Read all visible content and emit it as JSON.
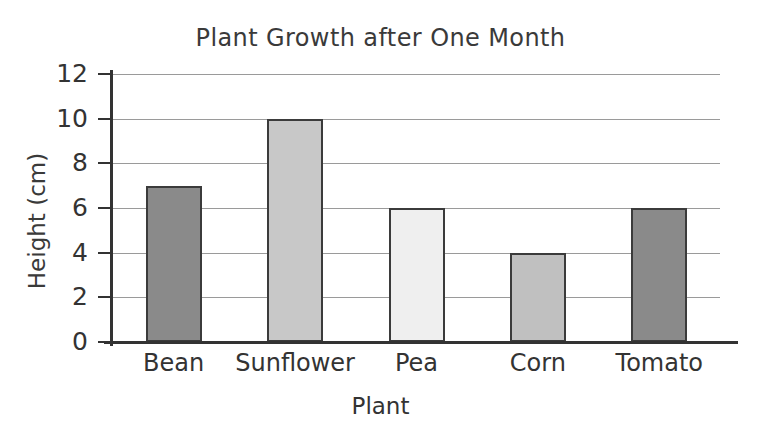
{
  "chart_data": {
    "type": "bar",
    "title": "Plant Growth after One Month",
    "xlabel": "Plant",
    "ylabel": "Height (cm)",
    "categories": [
      "Bean",
      "Sunflower",
      "Pea",
      "Corn",
      "Tomato"
    ],
    "values": [
      7,
      10,
      6,
      4,
      6
    ],
    "ylim": [
      0,
      12
    ],
    "ytick_labels": [
      "12",
      "10",
      "8",
      "6",
      "4",
      "2",
      "0"
    ],
    "ytick_values": [
      12,
      10,
      8,
      6,
      4,
      2,
      0
    ],
    "ystep": 2,
    "grid": true,
    "legend": "none",
    "bar_colors": [
      "#8a8a8a",
      "#c8c8c8",
      "#efefef",
      "#c0c0c0",
      "#8a8a8a"
    ],
    "bar_edge_color": "#3b3b3b",
    "gridline_color": "#9a9a9a",
    "axis_color": "#333333",
    "text_color": "#333333",
    "title_color": "#3a3a3a",
    "background": "#ffffff"
  }
}
